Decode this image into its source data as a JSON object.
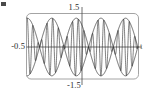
{
  "figure": {
    "name": "beat-waveform-plot",
    "background_color": "#ffffff",
    "frame_color": "#9a9a9a",
    "curve_color": "#2b2b2b",
    "axis_color": "#4a4a4a",
    "corner_mark_color": "#4a4a4a"
  },
  "labels": {
    "top": "1.5",
    "bottom": "-1.5",
    "left": "-0.5",
    "right": "t"
  },
  "chart_data": {
    "type": "line",
    "title": "",
    "subtitle": "",
    "xlabel": "t",
    "ylabel": "",
    "grid": false,
    "legend": null,
    "legend_position": "none",
    "xlim": [
      -0.5,
      1.0
    ],
    "ylim": [
      -1.5,
      1.5
    ],
    "xticks": [
      -0.5
    ],
    "xtick_labels": [
      "-0.5"
    ],
    "yticks": [
      -1.5,
      1.5
    ],
    "ytick_labels": [
      "-1.5",
      "1.5"
    ],
    "series": [
      {
        "name": "carrier",
        "formula": "y = 1.35 * cos(2*pi*1.5*t) * cos(2*pi*13*t)",
        "envelope_amplitude": 1.35,
        "envelope_frequency": 1.5,
        "carrier_frequency": 13,
        "color": "#2b2b2b",
        "linewidth": 0.6
      },
      {
        "name": "upper-envelope",
        "formula": "y = 1.35 * |cos(2*pi*1.5*t)|",
        "color": "#2b2b2b",
        "linewidth": 0.7
      },
      {
        "name": "lower-envelope",
        "formula": "y = -1.35 * |cos(2*pi*1.5*t)|",
        "color": "#2b2b2b",
        "linewidth": 0.7
      }
    ],
    "envelope_lobes": 3,
    "peak_value": 1.35,
    "trough_value": -1.35
  }
}
